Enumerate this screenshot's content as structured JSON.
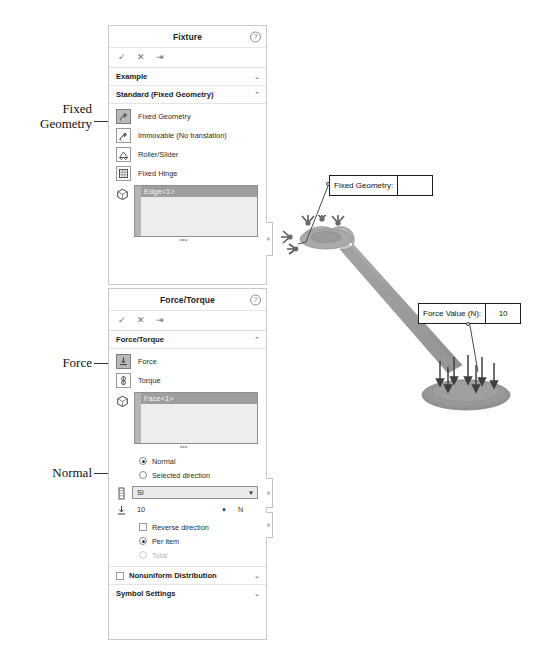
{
  "annotations": [
    {
      "id": "fixed-geometry",
      "text": "Fixed\nGeometry"
    },
    {
      "id": "force",
      "text": "Force"
    },
    {
      "id": "normal",
      "text": "Normal"
    }
  ],
  "fixture_panel": {
    "title": "Fixture",
    "help_icon": "help-icon",
    "commands": {
      "ok": "✓",
      "cancel": "✕",
      "pin": "⇥"
    },
    "example_section": {
      "label": "Example",
      "chevron": "⌄"
    },
    "standard_section": {
      "label": "Standard (Fixed Geometry)",
      "chevron": "⌃",
      "options": [
        {
          "label": "Fixed Geometry",
          "icon": "fixed-geometry-icon",
          "selected": true
        },
        {
          "label": "Immovable (No translation)",
          "icon": "immovable-icon",
          "selected": false
        },
        {
          "label": "Roller/Slider",
          "icon": "roller-slider-icon",
          "selected": false
        },
        {
          "label": "Fixed Hinge",
          "icon": "fixed-hinge-icon",
          "selected": false
        }
      ],
      "selection": {
        "icon": "face-select-icon",
        "items": [
          "Edge<1>"
        ]
      }
    }
  },
  "force_panel": {
    "title": "Force/Torque",
    "help_icon": "help-icon",
    "commands": {
      "ok": "✓",
      "cancel": "✕",
      "pin": "⇥"
    },
    "type_section": {
      "label": "Force/Torque",
      "chevron": "⌃",
      "options": [
        {
          "label": "Force",
          "icon": "force-icon",
          "selected": true
        },
        {
          "label": "Torque",
          "icon": "torque-icon",
          "selected": false
        }
      ],
      "selection": {
        "icon": "face-select-icon",
        "items": [
          "Face<1>"
        ]
      }
    },
    "direction": {
      "normal": {
        "label": "Normal",
        "selected": true
      },
      "selected_direction": {
        "label": "Selected direction",
        "selected": false
      }
    },
    "units": {
      "icon": "units-icon",
      "value": "SI",
      "caret": "▼"
    },
    "value": {
      "icon": "force-value-icon",
      "value": "10",
      "caret": "▼",
      "unit": "N"
    },
    "reverse_direction": {
      "label": "Reverse direction",
      "checked": false
    },
    "per_item": {
      "label": "Per item",
      "selected": true
    },
    "total": {
      "label": "Total",
      "selected": false,
      "disabled": true
    },
    "nonuniform": {
      "label": "Nonuniform Distribution",
      "checked": false,
      "chevron": "⌄"
    },
    "symbol_settings": {
      "label": "Symbol Settings",
      "chevron": "⌄"
    }
  },
  "model": {
    "callouts": [
      {
        "id": "fixed-geometry-callout",
        "label": "Fixed Geometry:",
        "value": ""
      },
      {
        "id": "force-value-callout",
        "label": "Force Value (N):",
        "value": "10"
      }
    ]
  }
}
